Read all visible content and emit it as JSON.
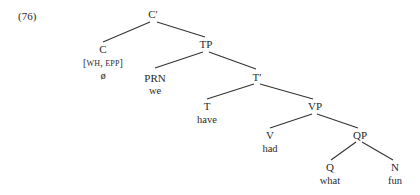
{
  "example_number": "(76)",
  "tree": {
    "nodes": {
      "cbar": {
        "label": "C′"
      },
      "c": {
        "label": "C",
        "features": "[WH, EPP]",
        "word": "ø"
      },
      "tp": {
        "label": "TP"
      },
      "prn": {
        "label": "PRN",
        "word": "we"
      },
      "tbar": {
        "label": "T′"
      },
      "t": {
        "label": "T",
        "word": "have"
      },
      "vp": {
        "label": "VP"
      },
      "v": {
        "label": "V",
        "word": "had"
      },
      "qp": {
        "label": "QP"
      },
      "q": {
        "label": "Q",
        "word": "what"
      },
      "n": {
        "label": "N",
        "word": "fun"
      }
    },
    "edges": [
      [
        "cbar",
        "c"
      ],
      [
        "cbar",
        "tp"
      ],
      [
        "tp",
        "prn"
      ],
      [
        "tp",
        "tbar"
      ],
      [
        "tbar",
        "t"
      ],
      [
        "tbar",
        "vp"
      ],
      [
        "vp",
        "v"
      ],
      [
        "vp",
        "qp"
      ],
      [
        "qp",
        "q"
      ],
      [
        "qp",
        "n"
      ]
    ]
  },
  "features_parts": {
    "open": "[",
    "wh": "WH",
    "sep": ", ",
    "epp": "EPP",
    "close": "]"
  }
}
